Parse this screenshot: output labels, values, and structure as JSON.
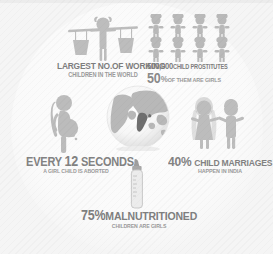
{
  "infographic": {
    "theme_colors": {
      "background": "#f5f5f5",
      "circle": "#fbfbfb",
      "art_fill": "#b6b6b6",
      "text_primary": "#808080",
      "text_secondary": "#9c9c9c",
      "globe_land": "#b4b4b4",
      "globe_ocean": "#f0f0f0",
      "india_highlight": "#6f6f6f"
    },
    "stats": [
      {
        "id": "working-children",
        "icon": "water-carrying-child-icon",
        "line1": "LARGEST NO.OF WORKING",
        "line2": "CHILDREN IN THE WORLD",
        "value": null
      },
      {
        "id": "child-prostitutes",
        "icon": "people-group-icon",
        "value": "500,000",
        "line1_rest": "CHILD PROSTITUTES",
        "percent": "50",
        "percent_sign": "%",
        "line2_rest": "OF THEM ARE GIRLS",
        "figure_count": 8,
        "figure_rows": 2
      },
      {
        "id": "girl-child-abortion",
        "icon": "pregnant-woman-icon",
        "prefix": "EVERY",
        "value": "12",
        "suffix": "SECONDS",
        "line2": "A GIRL CHILD IS ABORTED"
      },
      {
        "id": "child-marriages",
        "icon": "bride-and-groom-icon",
        "value": "40%",
        "line1_rest": "CHILD MARRIAGES",
        "line2": "HAPPEN IN INDIA"
      },
      {
        "id": "malnutrition",
        "icon": "baby-bottle-icon",
        "value": "75%",
        "line1_rest": "MALNUTRITIONED",
        "line2": "CHILDREN ARE GIRLS"
      }
    ],
    "globe": {
      "icon": "globe-icon",
      "highlighted_region": "India"
    }
  }
}
